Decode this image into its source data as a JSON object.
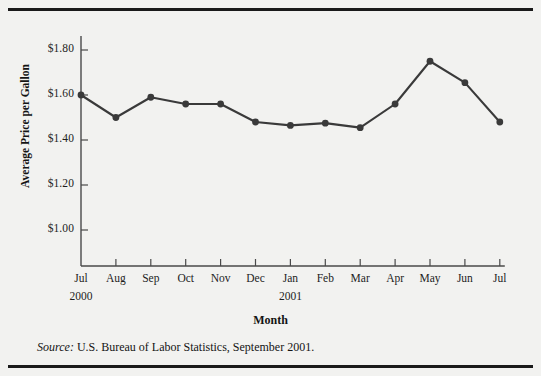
{
  "figure": {
    "source_label": "Source:",
    "source_text": " U.S. Bureau of Labor Statistics, September 2001."
  },
  "chart_data": {
    "type": "line",
    "title": "",
    "xlabel": "Month",
    "ylabel": "Average Price per Gallon",
    "categories": [
      "Jul",
      "Aug",
      "Sep",
      "Oct",
      "Nov",
      "Dec",
      "Jan",
      "Feb",
      "Mar",
      "Apr",
      "May",
      "Jun",
      "Jul"
    ],
    "group_labels": [
      {
        "text": "2000",
        "index": 0
      },
      {
        "text": "2001",
        "index": 6
      }
    ],
    "values": [
      1.6,
      1.5,
      1.59,
      1.56,
      1.56,
      1.48,
      1.465,
      1.475,
      1.455,
      1.56,
      1.75,
      1.655,
      1.48
    ],
    "ytick_labels": [
      "$1.80",
      "$1.60",
      "$1.40",
      "$1.20",
      "$1.00"
    ],
    "yticks": [
      1.8,
      1.6,
      1.4,
      1.2,
      1.0
    ],
    "ylim": [
      0.91,
      1.893
    ],
    "grid": false,
    "legend": "none",
    "marker": "filled-circle",
    "line_color": "#3a3a3a",
    "axis_color": "#4a4a4a",
    "background_color": "#f2f2f0"
  }
}
